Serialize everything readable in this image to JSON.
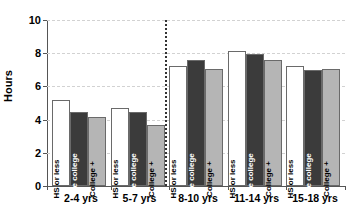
{
  "chart_data": {
    "type": "bar",
    "title": "",
    "subtitle": "",
    "xlabel": "",
    "ylabel": "Hours",
    "categories": [
      "2-4 yrs",
      "5-7 yrs",
      "8-10 yrs",
      "11-14 yrs",
      "15-18 yrs"
    ],
    "series": [
      {
        "name": "HS or less",
        "values": [
          5.2,
          4.7,
          7.25,
          8.15,
          7.2
        ],
        "color": "#ffffff",
        "text_color": "#000000"
      },
      {
        "name": "Some college",
        "values": [
          4.45,
          4.45,
          7.6,
          7.95,
          7.0
        ],
        "color": "#3b3b3b",
        "text_color": "#ffffff"
      },
      {
        "name": "College +",
        "values": [
          4.15,
          3.65,
          7.05,
          7.6,
          7.05
        ],
        "color": "#b5b5b5",
        "text_color": "#000000"
      }
    ],
    "ylim": [
      0,
      10
    ],
    "yticks": [
      0,
      2,
      4,
      6,
      8,
      10
    ],
    "ytick_labels": [
      "0",
      "2",
      "4",
      "6",
      "8",
      "10"
    ],
    "grid": true,
    "grid_axis": "y",
    "legend": "in-bar",
    "legend_position": "inside-bars",
    "annotations": [
      {
        "type": "vertical-divider",
        "after_category": "5-7 yrs",
        "style": "dotted"
      }
    ]
  }
}
